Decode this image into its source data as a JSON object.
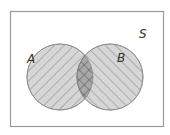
{
  "diagram": {
    "type": "venn",
    "universal_set": {
      "label": "S"
    },
    "sets": [
      {
        "label": "A",
        "hatch": "forward-diagonal"
      },
      {
        "label": "B",
        "hatch": "backward-diagonal"
      }
    ],
    "highlighted_region": "A ∩ B",
    "colors": {
      "border": "#9a9a9a",
      "circle_fill": "#d6d6d6",
      "hatch_line": "#8a8a8a",
      "intersection_fill": "#a8a8a8",
      "label": "#333333"
    }
  }
}
